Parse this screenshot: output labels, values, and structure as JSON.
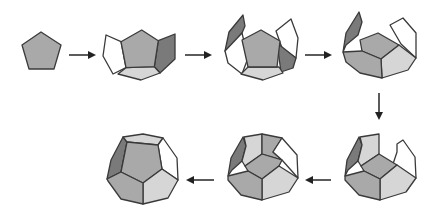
{
  "diagram": {
    "type": "process-sequence",
    "colors": {
      "background": "#ffffff",
      "edge": "#3a3a3a",
      "face_mid": "#a9a9a9",
      "face_dark": "#7a7a7a",
      "face_light": "#d6d6d6",
      "face_white": "#ffffff",
      "arrow": "#222222"
    },
    "steps": [
      {
        "id": 1,
        "label": "Single pentagon face"
      },
      {
        "id": 2,
        "label": "Base pentagon with first ring of faces partially folded"
      },
      {
        "id": 3,
        "label": "Base with side faces raised further"
      },
      {
        "id": 4,
        "label": "Lower half (bowl) formed"
      },
      {
        "id": 5,
        "label": "Upper faces beginning to close"
      },
      {
        "id": 6,
        "label": "Nearly closed dodecahedron"
      },
      {
        "id": 7,
        "label": "Completed dodecahedron"
      }
    ],
    "flow": [
      "1→2",
      "2→3",
      "3→4",
      "4↓5",
      "5←6",
      "6←7"
    ]
  }
}
